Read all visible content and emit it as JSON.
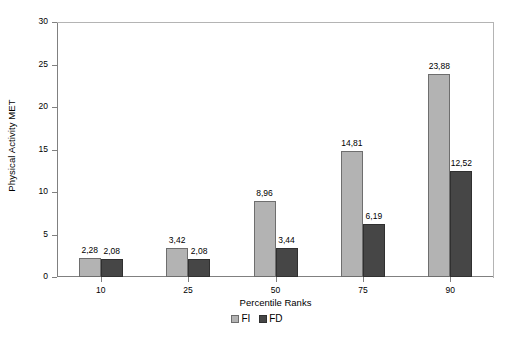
{
  "chart_data": {
    "type": "bar",
    "title": "",
    "xlabel": "Percentile Ranks",
    "ylabel": "Physical Activity MET",
    "categories": [
      "10",
      "25",
      "50",
      "75",
      "90"
    ],
    "ylim": [
      0,
      30
    ],
    "yticks": [
      0,
      5,
      10,
      15,
      20,
      25,
      30
    ],
    "ytick_labels": [
      "0",
      "5",
      "10",
      "15",
      "20",
      "25",
      "30"
    ],
    "grid": false,
    "legend_position": "bottom",
    "decimal_separator": ",",
    "series": [
      {
        "name": "FI",
        "color": "#b3b3b3",
        "values": [
          2.28,
          3.42,
          8.96,
          14.81,
          23.88
        ],
        "labels": [
          "2,28",
          "3,42",
          "8,96",
          "14,81",
          "23,88"
        ]
      },
      {
        "name": "FD",
        "color": "#464646",
        "values": [
          2.08,
          2.08,
          3.44,
          6.19,
          12.52
        ],
        "labels": [
          "2,08",
          "2,08",
          "3,44",
          "6,19",
          "12,52"
        ]
      }
    ]
  },
  "legend": {
    "entries": [
      {
        "label": "FI"
      },
      {
        "label": "FD"
      }
    ]
  },
  "colors": {
    "series_fi": "#b3b3b3",
    "series_fd": "#464646",
    "axis": "#808080",
    "frame": "#b4b4b4",
    "background": "#ffffff"
  }
}
